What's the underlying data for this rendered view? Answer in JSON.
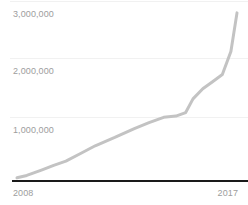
{
  "chart_data": {
    "type": "line",
    "title": "",
    "subtitle": "",
    "xlabel": "",
    "ylabel": "",
    "grid": true,
    "legend": false,
    "legend_position": "none",
    "line_color": "#c3c3c3",
    "axis_color": "#1a1a1a",
    "gridline_color": "#f1f1f1",
    "tick_label_color": "#9d9d9d",
    "xlim": [
      2008,
      2017
    ],
    "ylim": [
      0,
      3000000
    ],
    "y_ticks": [
      1000000,
      2000000,
      3000000
    ],
    "y_tick_labels": [
      "1,000,000",
      "2,000,000",
      "3,000,000"
    ],
    "x_ticks": [
      2008,
      2017
    ],
    "x_tick_labels": [
      "2008",
      "2017"
    ],
    "x": [
      2008,
      2008.4,
      2009,
      2009.5,
      2010,
      2010.6,
      2011.2,
      2012,
      2012.8,
      2013.4,
      2014,
      2014.5,
      2014.9,
      2015.2,
      2015.6,
      2016.0,
      2016.4,
      2016.75,
      2017
    ],
    "values": [
      20000,
      60000,
      150000,
      230000,
      300000,
      430000,
      560000,
      700000,
      850000,
      950000,
      1040000,
      1060000,
      1120000,
      1350000,
      1520000,
      1640000,
      1760000,
      2150000,
      2800000
    ],
    "series": [
      {
        "name": "series-1",
        "values": [
          20000,
          60000,
          150000,
          230000,
          300000,
          430000,
          560000,
          700000,
          850000,
          950000,
          1040000,
          1060000,
          1120000,
          1350000,
          1520000,
          1640000,
          1760000,
          2150000,
          2800000
        ]
      }
    ],
    "annotations": []
  },
  "axes": {
    "y_labels": [
      {
        "text": "3,000,000",
        "top": 9
      },
      {
        "text": "2,000,000",
        "top": 66
      },
      {
        "text": "1,000,000",
        "top": 125
      }
    ],
    "gridlines": [
      {
        "top": 1
      },
      {
        "top": 58
      },
      {
        "top": 117
      }
    ],
    "x_labels": {
      "left": "2008",
      "right": "2017"
    }
  }
}
